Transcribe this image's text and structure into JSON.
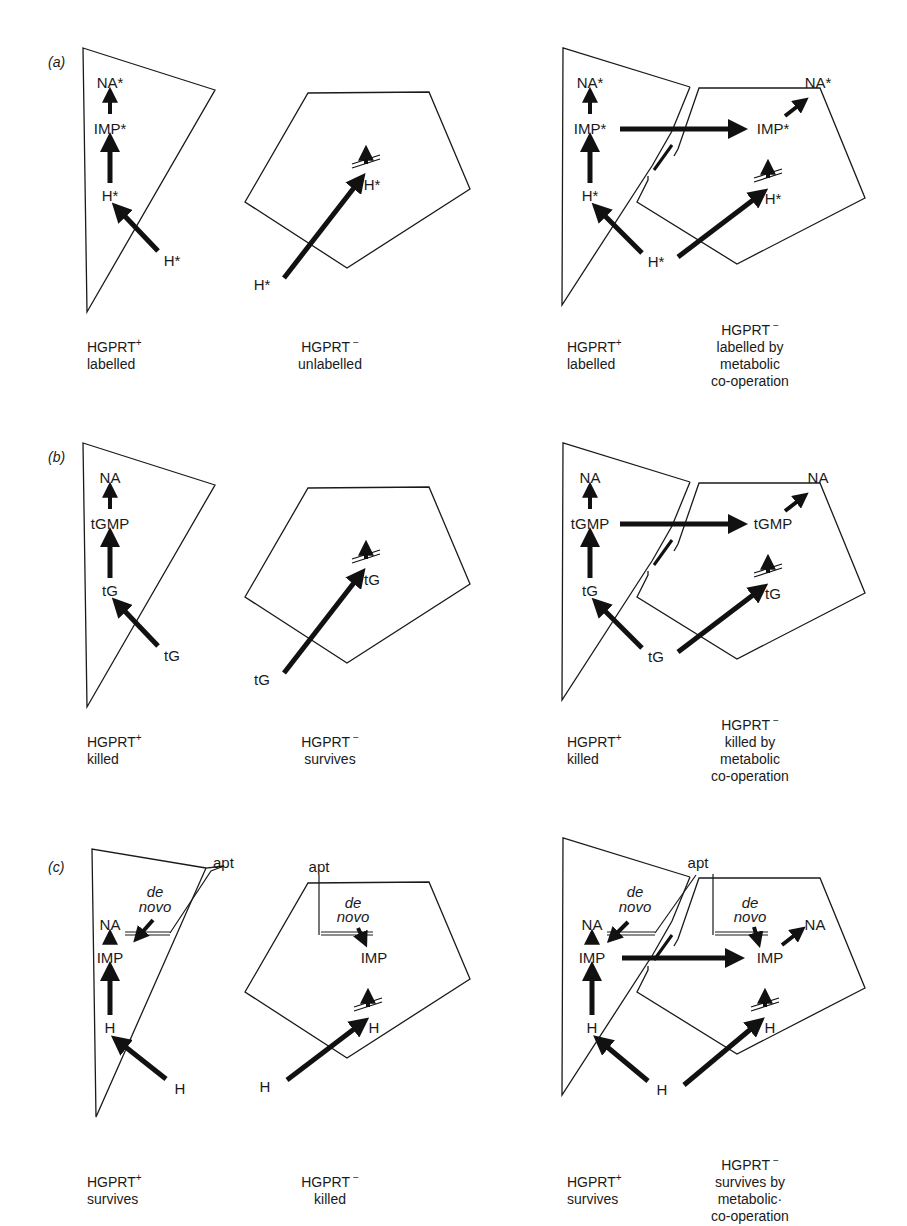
{
  "panels": [
    {
      "id": "a",
      "label": "(a)",
      "cell1": {
        "na": "NA*",
        "nuc": "IMP*",
        "base_in": "H*",
        "base_out": "H*"
      },
      "cell2": {
        "base_in": "H*",
        "base_out": "H*"
      },
      "coop_left": {
        "na": "NA*",
        "nuc": "IMP*",
        "base_in": "H*"
      },
      "coop_right": {
        "na": "NA*",
        "nuc": "IMP*",
        "base_in": "H*"
      },
      "coop_base_out": "H*",
      "captions": {
        "c1": {
          "name": "HGPRT",
          "sign": "+",
          "lines": [
            "labelled"
          ]
        },
        "c2": {
          "name": "HGPRT",
          "sign": "−",
          "lines": [
            "unlabelled"
          ]
        },
        "c3": {
          "name": "HGPRT",
          "sign": "+",
          "lines": [
            "labelled"
          ]
        },
        "c4": {
          "name": "HGPRT",
          "sign": "−",
          "lines": [
            "labelled by",
            "metabolic",
            "co-operation"
          ]
        }
      }
    },
    {
      "id": "b",
      "label": "(b)",
      "cell1": {
        "na": "NA",
        "nuc": "tGMP",
        "base_in": "tG",
        "base_out": "tG"
      },
      "cell2": {
        "base_in": "tG",
        "base_out": "tG"
      },
      "coop_left": {
        "na": "NA",
        "nuc": "tGMP",
        "base_in": "tG"
      },
      "coop_right": {
        "na": "NA",
        "nuc": "tGMP",
        "base_in": "tG"
      },
      "coop_base_out": "tG",
      "captions": {
        "c1": {
          "name": "HGPRT",
          "sign": "+",
          "lines": [
            "killed"
          ]
        },
        "c2": {
          "name": "HGPRT",
          "sign": "−",
          "lines": [
            "survives"
          ]
        },
        "c3": {
          "name": "HGPRT",
          "sign": "+",
          "lines": [
            "killed"
          ]
        },
        "c4": {
          "name": "HGPRT",
          "sign": "−",
          "lines": [
            "killed by",
            "metabolic",
            "co-operation"
          ]
        }
      }
    },
    {
      "id": "c",
      "label": "(c)",
      "inhibitor": "apt",
      "de_novo": [
        "de",
        "novo"
      ],
      "cell1": {
        "na": "NA",
        "nuc": "IMP",
        "base_in": "H",
        "base_out": "H"
      },
      "cell2": {
        "nuc": "IMP",
        "base_in": "H",
        "base_out": "H"
      },
      "coop_left": {
        "na": "NA",
        "nuc": "IMP",
        "base_in": "H"
      },
      "coop_right": {
        "na": "NA",
        "nuc": "IMP",
        "base_in": "H"
      },
      "coop_base_out": "H",
      "captions": {
        "c1": {
          "name": "HGPRT",
          "sign": "+",
          "lines": [
            "survives"
          ]
        },
        "c2": {
          "name": "HGPRT",
          "sign": "−",
          "lines": [
            "killed"
          ]
        },
        "c3": {
          "name": "HGPRT",
          "sign": "+",
          "lines": [
            "survives"
          ]
        },
        "c4": {
          "name": "HGPRT",
          "sign": "−",
          "lines": [
            "survives by",
            "metabolic·",
            "co-operation"
          ]
        }
      }
    }
  ]
}
